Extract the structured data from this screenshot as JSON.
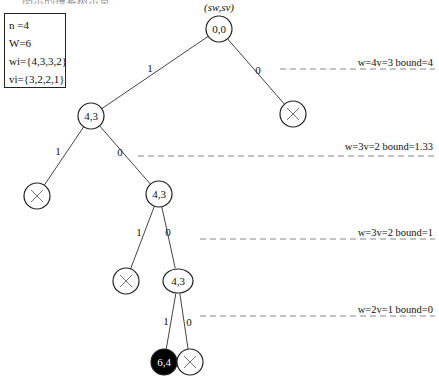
{
  "top_caption_fragment": "……图示的搜索树示意……",
  "legend": {
    "n": "n =4",
    "W": "W=6",
    "w": "wi={4,3,3,2}",
    "v": "vi={3,2,2,1}"
  },
  "root_label": "(sw,sv)",
  "nodes": [
    {
      "id": "root",
      "label": "0,0",
      "cx": 219,
      "cy": 29,
      "type": "normal"
    },
    {
      "id": "l1-take",
      "label": "4,3",
      "cx": 91,
      "cy": 116,
      "type": "normal"
    },
    {
      "id": "l1-skip",
      "label": "",
      "cx": 293,
      "cy": 114,
      "type": "pruned"
    },
    {
      "id": "l2-take",
      "label": "",
      "cx": 37,
      "cy": 196,
      "type": "pruned"
    },
    {
      "id": "l2-skip",
      "label": "4,3",
      "cx": 159,
      "cy": 194,
      "type": "normal"
    },
    {
      "id": "l3-take",
      "label": "",
      "cx": 126,
      "cy": 281,
      "type": "pruned"
    },
    {
      "id": "l3-skip",
      "label": "4,3",
      "cx": 178,
      "cy": 281,
      "type": "ellipse"
    },
    {
      "id": "l4-take",
      "label": "6,4",
      "cx": 164,
      "cy": 362,
      "type": "solution"
    },
    {
      "id": "l4-skip",
      "label": "",
      "cx": 190,
      "cy": 362,
      "type": "pruned"
    }
  ],
  "edges": [
    {
      "from": "root",
      "to": "l1-take",
      "label": "1",
      "lx": 150,
      "ly": 72
    },
    {
      "from": "root",
      "to": "l1-skip",
      "label": "0",
      "lx": 258,
      "ly": 74
    },
    {
      "from": "l1-take",
      "to": "l2-take",
      "label": "1",
      "lx": 58,
      "ly": 155
    },
    {
      "from": "l1-take",
      "to": "l2-skip",
      "label": "0",
      "lx": 120,
      "ly": 156
    },
    {
      "from": "l2-skip",
      "to": "l3-take",
      "label": "1",
      "lx": 139,
      "ly": 236
    },
    {
      "from": "l2-skip",
      "to": "l3-skip",
      "label": "0",
      "lx": 168,
      "ly": 236
    },
    {
      "from": "l3-skip",
      "to": "l4-take",
      "label": "1",
      "lx": 166,
      "ly": 325
    },
    {
      "from": "l3-skip",
      "to": "l4-skip",
      "label": "0",
      "lx": 189,
      "ly": 326
    }
  ],
  "bounds": [
    {
      "text": "w=4v=3 bound=4",
      "y": 66,
      "line_y": 69,
      "x1": 280,
      "x2": 435
    },
    {
      "text": "w=3v=2 bound=1.33",
      "y": 150,
      "line_y": 156,
      "x1": 138,
      "x2": 435
    },
    {
      "text": "w=3v=2 bound=1",
      "y": 236,
      "line_y": 239,
      "x1": 200,
      "x2": 435
    },
    {
      "text": "w=2v=1 bound=0",
      "y": 313,
      "line_y": 316,
      "x1": 200,
      "x2": 435
    }
  ],
  "colors": {
    "stroke": "#222222",
    "edge": "#444444",
    "dash": "#888888",
    "solution_fill": "#000000",
    "solution_text": "#ffffff"
  }
}
